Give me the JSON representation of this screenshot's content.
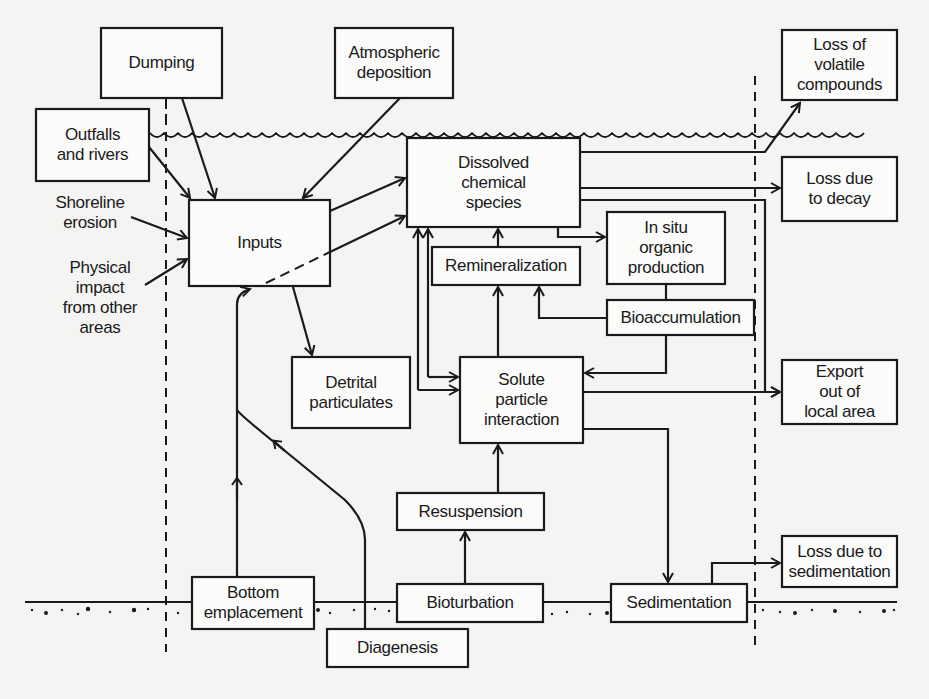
{
  "diagram": {
    "nodes": {
      "dumping": "Dumping",
      "atmospheric": "Atmospheric\ndeposition",
      "outfalls": "Outfalls\nand rivers",
      "shoreline": "Shoreline\nerosion",
      "physical": "Physical\nimpact\nfrom other\nareas",
      "inputs": "Inputs",
      "dissolved": "Dissolved\nchemical\nspecies",
      "remineralization": "Remineralization",
      "insitu": "In situ\norganic\nproduction",
      "bioaccumulation": "Bioaccumulation",
      "detrital": "Detrital\nparticulates",
      "solute": "Solute\nparticle\ninteraction",
      "resuspension": "Resuspension",
      "bottom": "Bottom\nemplacement",
      "bioturbation": "Bioturbation",
      "diagenesis": "Diagenesis",
      "sedimentation": "Sedimentation",
      "loss_volatile": "Loss of\nvolatile\ncompounds",
      "loss_decay": "Loss due\nto decay",
      "export": "Export\nout of\nlocal area",
      "loss_sedimentation": "Loss due to\nsedimentation"
    },
    "edges": [
      {
        "from": "dumping",
        "to": "inputs"
      },
      {
        "from": "atmospheric",
        "to": "inputs"
      },
      {
        "from": "outfalls",
        "to": "inputs"
      },
      {
        "from": "shoreline",
        "to": "inputs"
      },
      {
        "from": "physical",
        "to": "inputs"
      },
      {
        "from": "inputs",
        "to": "dissolved"
      },
      {
        "from": "inputs",
        "to": "dissolved",
        "style": "dashed"
      },
      {
        "from": "inputs",
        "to": "detrital"
      },
      {
        "from": "bottom",
        "to": "inputs"
      },
      {
        "from": "diagenesis",
        "to": "inputs"
      },
      {
        "from": "dissolved",
        "to": "loss_volatile"
      },
      {
        "from": "dissolved",
        "to": "loss_decay"
      },
      {
        "from": "dissolved",
        "to": "export"
      },
      {
        "from": "dissolved",
        "to": "insitu"
      },
      {
        "from": "remineralization",
        "to": "dissolved"
      },
      {
        "from": "solute",
        "to": "dissolved"
      },
      {
        "from": "bioaccumulation",
        "to": "remineralization"
      },
      {
        "from": "bioaccumulation",
        "to": "solute"
      },
      {
        "from": "insitu",
        "to": "bioaccumulation"
      },
      {
        "from": "detrital",
        "to": "remineralization"
      },
      {
        "from": "detrital",
        "to": "solute"
      },
      {
        "from": "solute",
        "to": "export"
      },
      {
        "from": "solute",
        "to": "sedimentation"
      },
      {
        "from": "resuspension",
        "to": "solute"
      },
      {
        "from": "bioturbation",
        "to": "resuspension"
      },
      {
        "from": "sedimentation",
        "to": "loss_sedimentation"
      }
    ],
    "boundaries": {
      "water_surface": "wavy line",
      "sediment_surface": "dotted line",
      "local_area_limits": "dashed vertical lines"
    }
  }
}
